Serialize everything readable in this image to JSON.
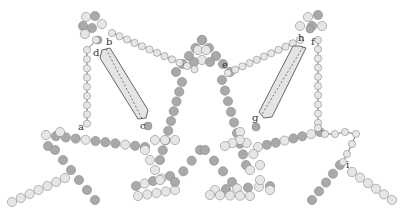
{
  "diagram": {
    "type": "bead-chain molecular assembly with two crystal units",
    "colors": {
      "bead_dark": "#a9a9a9",
      "bead_light": "#e6e6e6",
      "bead_stroke": "#8a8a8a",
      "crystal_fill": "#e4e4e4",
      "crystal_stroke": "#444444",
      "tether": "#333333"
    },
    "labels": [
      {
        "id": "a",
        "text": "a",
        "x": 78,
        "y": 130
      },
      {
        "id": "b",
        "text": "b",
        "x": 106,
        "y": 45
      },
      {
        "id": "c",
        "text": "c",
        "x": 140,
        "y": 129
      },
      {
        "id": "d",
        "text": "d",
        "x": 93,
        "y": 56
      },
      {
        "id": "e",
        "text": "e",
        "x": 222,
        "y": 68
      },
      {
        "id": "f",
        "text": "f",
        "x": 311,
        "y": 45
      },
      {
        "id": "g",
        "text": "g",
        "x": 252,
        "y": 121
      },
      {
        "id": "h",
        "text": "h",
        "x": 298,
        "y": 41
      },
      {
        "id": "i",
        "text": "i",
        "x": 346,
        "y": 168
      }
    ],
    "crystals": [
      {
        "name": "left-crystal",
        "points": "102,50 110,48 148,110 146,118 138,119 100,58"
      },
      {
        "name": "right-crystal",
        "points": "300,46 306,48 272,117 264,118 259,112 293,46"
      }
    ]
  }
}
